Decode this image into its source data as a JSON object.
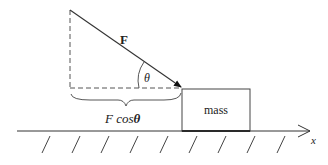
{
  "diagram": {
    "force_label": "F",
    "angle_label": "θ",
    "component_label_prefix": "F cos",
    "component_label_angle": "θ",
    "mass_label": "mass",
    "axis_label": "x"
  },
  "colors": {
    "stroke": "#333333",
    "text": "#222222",
    "background": "#ffffff"
  },
  "hatch_marks_count": 9
}
